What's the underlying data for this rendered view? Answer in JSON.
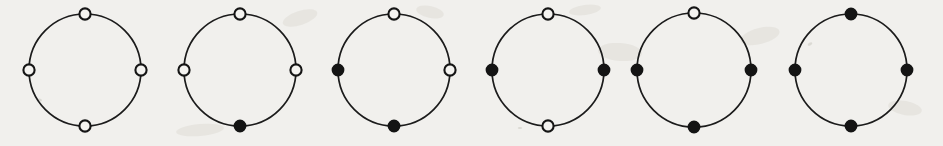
{
  "figure": {
    "background_color": "#f1f0ed",
    "ink_color": "#141414",
    "bead_white_fill": "#f4f3f0",
    "bead_black_fill": "#141414",
    "canvas": {
      "width": 943,
      "height": 146
    },
    "ring_radius": 56,
    "bead_radius": 5.6,
    "bead_positions": [
      "top",
      "right",
      "bottom",
      "left"
    ],
    "bead_states": [
      "white",
      "black"
    ],
    "necklaces": [
      {
        "index": 1,
        "label": "necklace-1",
        "center_x": 85,
        "center_y": 70,
        "radius": 56,
        "black_count": 0,
        "beads": [
          {
            "position": "top",
            "angle": -90,
            "state": "white"
          },
          {
            "position": "right",
            "angle": 0,
            "state": "white"
          },
          {
            "position": "bottom",
            "angle": 90,
            "state": "white"
          },
          {
            "position": "left",
            "angle": 180,
            "state": "white"
          }
        ]
      },
      {
        "index": 2,
        "label": "necklace-2",
        "center_x": 240,
        "center_y": 70,
        "radius": 56,
        "black_count": 1,
        "beads": [
          {
            "position": "top",
            "angle": -90,
            "state": "white"
          },
          {
            "position": "right",
            "angle": 0,
            "state": "white"
          },
          {
            "position": "bottom",
            "angle": 90,
            "state": "black"
          },
          {
            "position": "left",
            "angle": 180,
            "state": "white"
          }
        ]
      },
      {
        "index": 3,
        "label": "necklace-3",
        "center_x": 394,
        "center_y": 70,
        "radius": 56,
        "black_count": 2,
        "beads": [
          {
            "position": "top",
            "angle": -90,
            "state": "white"
          },
          {
            "position": "right",
            "angle": 0,
            "state": "white"
          },
          {
            "position": "bottom",
            "angle": 90,
            "state": "black"
          },
          {
            "position": "left",
            "angle": 180,
            "state": "black"
          }
        ]
      },
      {
        "index": 4,
        "label": "necklace-4",
        "center_x": 548,
        "center_y": 70,
        "radius": 56,
        "black_count": 2,
        "beads": [
          {
            "position": "top",
            "angle": -90,
            "state": "white"
          },
          {
            "position": "right",
            "angle": 0,
            "state": "black"
          },
          {
            "position": "bottom",
            "angle": 90,
            "state": "white"
          },
          {
            "position": "left",
            "angle": 180,
            "state": "black"
          }
        ]
      },
      {
        "index": 5,
        "label": "necklace-5",
        "center_x": 694,
        "center_y": 70,
        "radius": 57,
        "black_count": 3,
        "beads": [
          {
            "position": "top",
            "angle": -90,
            "state": "white"
          },
          {
            "position": "right",
            "angle": 0,
            "state": "black"
          },
          {
            "position": "bottom",
            "angle": 90,
            "state": "black"
          },
          {
            "position": "left",
            "angle": 180,
            "state": "black"
          }
        ]
      },
      {
        "index": 6,
        "label": "necklace-6",
        "center_x": 851,
        "center_y": 70,
        "radius": 56,
        "black_count": 4,
        "beads": [
          {
            "position": "top",
            "angle": -90,
            "state": "black"
          },
          {
            "position": "right",
            "angle": 0,
            "state": "black"
          },
          {
            "position": "bottom",
            "angle": 90,
            "state": "black"
          },
          {
            "position": "left",
            "angle": 180,
            "state": "black"
          }
        ]
      }
    ],
    "paper_artifacts": [
      {
        "name": "smudge-a",
        "cx": 300,
        "cy": 18,
        "rx": 18,
        "ry": 7,
        "rot": -18
      },
      {
        "name": "smudge-b",
        "cx": 430,
        "cy": 12,
        "rx": 14,
        "ry": 6,
        "rot": 12
      },
      {
        "name": "smudge-c",
        "cx": 585,
        "cy": 10,
        "rx": 16,
        "ry": 5,
        "rot": -8
      },
      {
        "name": "smudge-d",
        "cx": 620,
        "cy": 52,
        "rx": 22,
        "ry": 9,
        "rot": 4
      },
      {
        "name": "smudge-e",
        "cx": 760,
        "cy": 36,
        "rx": 20,
        "ry": 8,
        "rot": -14
      },
      {
        "name": "smudge-f",
        "cx": 905,
        "cy": 108,
        "rx": 17,
        "ry": 7,
        "rot": 10
      },
      {
        "name": "smudge-g",
        "cx": 200,
        "cy": 130,
        "rx": 24,
        "ry": 6,
        "rot": -5
      },
      {
        "name": "fleck-a",
        "cx": 810,
        "cy": 44,
        "rx": 2.5,
        "ry": 1.4,
        "rot": -30
      },
      {
        "name": "fleck-b",
        "cx": 40,
        "cy": 100,
        "rx": 2,
        "ry": 1.2,
        "rot": 20
      },
      {
        "name": "fleck-c",
        "cx": 520,
        "cy": 128,
        "rx": 2.2,
        "ry": 1.1,
        "rot": 0
      }
    ]
  }
}
